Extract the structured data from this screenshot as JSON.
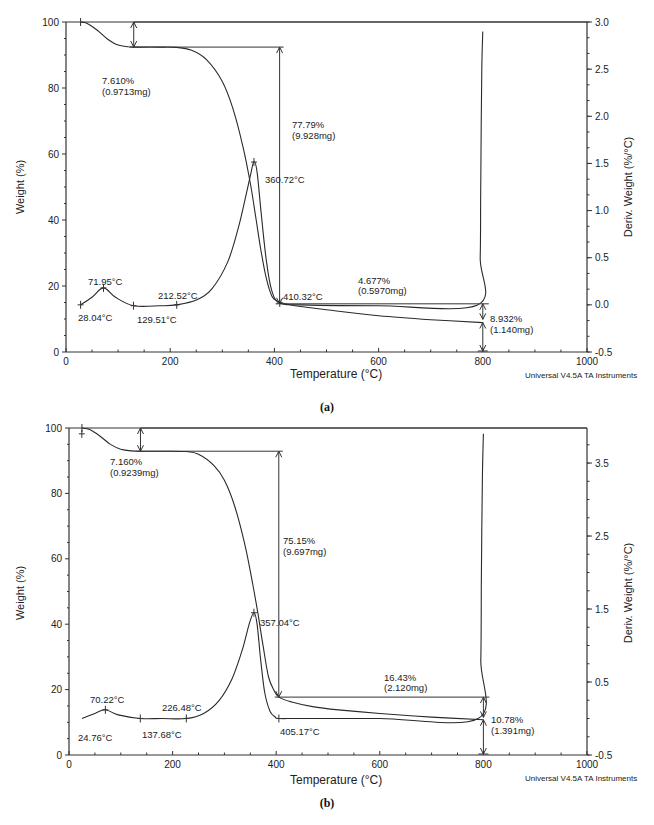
{
  "chart_data": [
    {
      "id": "a",
      "type": "line",
      "caption": "(a)",
      "xlabel": "Temperature (°C)",
      "ylabel": "Weight (%)",
      "y2label": "Deriv. Weight (%/°C)",
      "credit": "Universal V4.5A TA Instruments",
      "xlim": [
        0,
        1000
      ],
      "ylim": [
        0,
        100
      ],
      "y2lim": [
        -0.5,
        3.0
      ],
      "xticks": [
        0,
        200,
        400,
        600,
        800,
        1000
      ],
      "yticks": [
        0,
        20,
        40,
        60,
        80,
        100
      ],
      "y2ticks": [
        -0.5,
        0.0,
        0.5,
        1.0,
        1.5,
        2.0,
        2.5,
        3.0
      ],
      "y2tick_labels": [
        "-0.5",
        "0.0",
        "0.5",
        "1.0",
        "1.5",
        "2.0",
        "2.5",
        "3.0"
      ],
      "grid": false,
      "plot_box": {
        "x0": 66,
        "x1": 587,
        "y_top": 22,
        "y_bottom": 352
      },
      "series": [
        {
          "name": "Weight (%)",
          "axis": "left",
          "x": [
            28,
            40,
            60,
            80,
            100,
            120,
            130,
            180,
            212,
            240,
            270,
            300,
            320,
            340,
            355,
            365,
            375,
            385,
            395,
            405,
            420,
            450,
            500,
            600,
            700,
            800
          ],
          "values": [
            100,
            99.6,
            97.5,
            94.8,
            93.0,
            92.5,
            92.4,
            92.4,
            92.3,
            91.5,
            88.5,
            82,
            74,
            62,
            50,
            40,
            30,
            22,
            17,
            15.5,
            14.6,
            13.8,
            12.8,
            11.0,
            9.8,
            8.9
          ]
        },
        {
          "name": "Deriv. Weight (%/°C)",
          "axis": "right",
          "x": [
            28,
            50,
            72,
            95,
            130,
            180,
            212,
            250,
            280,
            310,
            330,
            345,
            355,
            361,
            367,
            375,
            385,
            395,
            410,
            450,
            600,
            790,
            795,
            796,
            797,
            798,
            800
          ],
          "values": [
            0.0,
            0.08,
            0.18,
            0.08,
            -0.01,
            -0.01,
            0.0,
            0.05,
            0.17,
            0.45,
            0.8,
            1.15,
            1.4,
            1.52,
            1.4,
            0.95,
            0.45,
            0.15,
            0.02,
            0.0,
            -0.01,
            0.0,
            0.5,
            1.2,
            1.9,
            2.5,
            2.9
          ]
        }
      ],
      "annotations": [
        {
          "type": "step",
          "text": "7.610%",
          "text2": "(0.9713mg)",
          "x": 130,
          "from": 100,
          "to": 92.4
        },
        {
          "type": "step",
          "text": "77.79%",
          "text2": "(9.928mg)",
          "x": 410,
          "from": 92.4,
          "to": 14.6
        },
        {
          "type": "step",
          "text": "4.677%",
          "text2": "(0.5970mg)",
          "x": 800,
          "from": 14.6,
          "to": 9.9
        },
        {
          "type": "residue",
          "text": "8.932%",
          "text2": "(1.140mg)",
          "x": 800,
          "value": 8.932
        },
        {
          "type": "peak",
          "text": "71.95°C",
          "x": 71.95
        },
        {
          "type": "peak",
          "text": "360.72°C",
          "x": 360.72
        },
        {
          "type": "onset",
          "text": "28.04°C",
          "x": 28.04
        },
        {
          "type": "onset",
          "text": "129.51°C",
          "x": 129.51
        },
        {
          "type": "onset",
          "text": "212.52°C",
          "x": 212.52
        },
        {
          "type": "onset",
          "text": "410.32°C",
          "x": 410.32
        }
      ]
    },
    {
      "id": "b",
      "type": "line",
      "caption": "(b)",
      "xlabel": "Temperature (°C)",
      "ylabel": "Weight (%)",
      "y2label": "Deriv. Weight (%/°C)",
      "credit": "Universal V4.5A TA Instruments",
      "xlim": [
        0,
        1000
      ],
      "ylim": [
        0,
        100
      ],
      "y2lim": [
        -0.5,
        3.98
      ],
      "xticks": [
        0,
        200,
        400,
        600,
        800,
        1000
      ],
      "yticks": [
        0,
        20,
        40,
        60,
        80,
        100
      ],
      "y2ticks": [
        -0.5,
        0.5,
        1.5,
        2.5,
        3.5
      ],
      "y2tick_labels": [
        "-0.5",
        "0.5",
        "1.5",
        "2.5",
        "3.5"
      ],
      "grid": false,
      "plot_box": {
        "x0": 69,
        "x1": 587,
        "y_top": 428,
        "y_bottom": 755
      },
      "series": [
        {
          "name": "Weight (%)",
          "axis": "left",
          "x": [
            25,
            40,
            60,
            80,
            100,
            120,
            138,
            180,
            226,
            250,
            280,
            300,
            320,
            340,
            355,
            365,
            375,
            385,
            395,
            405,
            430,
            470,
            520,
            600,
            700,
            800
          ],
          "values": [
            100,
            99.5,
            97.5,
            95,
            93.5,
            93.0,
            92.9,
            92.9,
            92.8,
            92.0,
            88.5,
            84,
            76,
            64,
            52,
            43,
            33,
            24,
            20,
            17.7,
            16.2,
            14.8,
            13.8,
            12.7,
            11.6,
            10.8
          ]
        },
        {
          "name": "Deriv. Weight (%/°C)",
          "axis": "right",
          "x": [
            25,
            50,
            70,
            95,
            138,
            180,
            226,
            260,
            290,
            315,
            335,
            348,
            357,
            363,
            370,
            378,
            388,
            398,
            405,
            450,
            600,
            790,
            795,
            796,
            797,
            798,
            800
          ],
          "values": [
            0.0,
            0.07,
            0.12,
            0.05,
            0.0,
            0.0,
            0.0,
            0.07,
            0.25,
            0.55,
            0.95,
            1.3,
            1.45,
            1.3,
            0.8,
            0.35,
            0.1,
            0.02,
            0.0,
            0.0,
            0.0,
            0.0,
            0.8,
            1.8,
            2.6,
            3.3,
            3.9
          ]
        }
      ],
      "annotations": [
        {
          "type": "step",
          "text": "7.160%",
          "text2": "(0.9239mg)",
          "x": 138,
          "from": 100,
          "to": 92.9
        },
        {
          "type": "step",
          "text": "75.15%",
          "text2": "(9.697mg)",
          "x": 405,
          "from": 92.9,
          "to": 17.7
        },
        {
          "type": "step",
          "text": "16.43%",
          "text2": "(2.120mg)",
          "x": 800,
          "from": 17.7,
          "to": 11.5
        },
        {
          "type": "residue",
          "text": "10.78%",
          "text2": "(1.391mg)",
          "x": 800,
          "value": 10.78
        },
        {
          "type": "peak",
          "text": "70.22°C",
          "x": 70.22
        },
        {
          "type": "peak",
          "text": "357.04°C",
          "x": 357.04
        },
        {
          "type": "onset",
          "text": "24.76°C",
          "x": 24.76
        },
        {
          "type": "onset",
          "text": "137.68°C",
          "x": 137.68
        },
        {
          "type": "onset",
          "text": "226.48°C",
          "x": 226.48
        },
        {
          "type": "onset",
          "text": "405.17°C",
          "x": 405.17
        }
      ]
    }
  ],
  "labels": {
    "a": {
      "step1": [
        "7.610%",
        "(0.9713mg)"
      ],
      "step2": [
        "77.79%",
        "(9.928mg)"
      ],
      "step3": [
        "4.677%",
        "(0.5970mg)"
      ],
      "residue": [
        "8.932%",
        "(1.140mg)"
      ],
      "peak1": "71.95°C",
      "peak2": "360.72°C",
      "on1": "28.04°C",
      "on2": "129.51°C",
      "on3": "212.52°C",
      "on4": "410.32°C"
    },
    "b": {
      "step1": [
        "7.160%",
        "(0.9239mg)"
      ],
      "step2": [
        "75.15%",
        "(9.697mg)"
      ],
      "step3": [
        "16.43%",
        "(2.120mg)"
      ],
      "residue": [
        "10.78%",
        "(1.391mg)"
      ],
      "peak1": "70.22°C",
      "peak2": "357.04°C",
      "on1": "24.76°C",
      "on2": "137.68°C",
      "on3": "226.48°C",
      "on4": "405.17°C"
    }
  }
}
